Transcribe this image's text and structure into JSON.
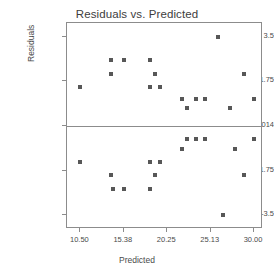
{
  "chart_data": {
    "type": "scatter",
    "title": "Residuals vs. Predicted",
    "xlabel": "Predicted",
    "ylabel": "Residuals",
    "grid": false,
    "legend": null,
    "xlim": [
      9.0,
      31.0
    ],
    "ylim": [
      -4.05,
      4.05
    ],
    "xticks": [
      10.5,
      15.38,
      20.25,
      25.13,
      30.0
    ],
    "xtick_labels": [
      "10.50",
      "15.38",
      "20.25",
      "25.13",
      "30.00"
    ],
    "yticks": [
      3.5,
      1.75,
      0,
      -1.75,
      -3.5
    ],
    "ytick_labels": [
      "3.5",
      "1.75",
      "1.06581E-014",
      "-1.75",
      "-3.5"
    ],
    "zero_reference_line": 0,
    "marker": "square",
    "marker_color": "#575757",
    "points": [
      {
        "x": 10.5,
        "y": 1.52
      },
      {
        "x": 10.5,
        "y": -1.4
      },
      {
        "x": 13.99,
        "y": 2.06
      },
      {
        "x": 13.99,
        "y": 2.6
      },
      {
        "x": 13.99,
        "y": -1.91
      },
      {
        "x": 14.21,
        "y": -2.46
      },
      {
        "x": 15.38,
        "y": 2.6
      },
      {
        "x": 15.38,
        "y": -2.46
      },
      {
        "x": 18.28,
        "y": 2.6
      },
      {
        "x": 18.28,
        "y": 1.52
      },
      {
        "x": 18.28,
        "y": -1.4
      },
      {
        "x": 18.28,
        "y": -2.46
      },
      {
        "x": 18.89,
        "y": 2.06
      },
      {
        "x": 18.89,
        "y": -1.91
      },
      {
        "x": 19.41,
        "y": 1.52
      },
      {
        "x": 19.41,
        "y": -1.4
      },
      {
        "x": 21.91,
        "y": 1.06
      },
      {
        "x": 21.91,
        "y": -0.9
      },
      {
        "x": 22.5,
        "y": 0.7
      },
      {
        "x": 22.5,
        "y": -0.5
      },
      {
        "x": 23.5,
        "y": 1.06
      },
      {
        "x": 23.5,
        "y": -0.5
      },
      {
        "x": 24.5,
        "y": 1.06
      },
      {
        "x": 24.5,
        "y": -0.5
      },
      {
        "x": 26.0,
        "y": 3.5
      },
      {
        "x": 26.5,
        "y": -3.5
      },
      {
        "x": 27.3,
        "y": 0.7
      },
      {
        "x": 27.9,
        "y": -0.9
      },
      {
        "x": 28.9,
        "y": 2.06
      },
      {
        "x": 28.9,
        "y": -1.91
      },
      {
        "x": 30.0,
        "y": 1.06
      },
      {
        "x": 30.0,
        "y": -0.5
      }
    ]
  }
}
